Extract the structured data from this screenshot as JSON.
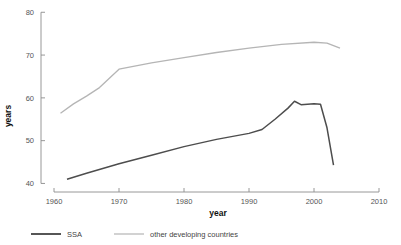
{
  "chart_data": {
    "type": "line",
    "title": "",
    "xlabel": "year",
    "ylabel": "years",
    "xlim": [
      1958,
      2012
    ],
    "ylim": [
      38,
      81
    ],
    "xticks": [
      1960,
      1970,
      1980,
      1990,
      2000,
      2010
    ],
    "yticks": [
      40,
      50,
      60,
      70,
      80
    ],
    "xtick_labels": [
      "1960",
      "1970",
      "1980",
      "1990",
      "2000",
      "2010"
    ],
    "ytick_labels": [
      "40",
      "50",
      "60",
      "70",
      "80"
    ],
    "grid": false,
    "legend_position": "bottom",
    "series": [
      {
        "name": "SSA",
        "color": "#4d4d4d",
        "width": 1.5,
        "x": [
          1962,
          1965,
          1970,
          1975,
          1980,
          1985,
          1990,
          1992,
          1994,
          1996,
          1997,
          1998,
          2000,
          2001,
          2002,
          2003
        ],
        "values": [
          41.0,
          42.4,
          44.6,
          46.6,
          48.6,
          50.3,
          51.7,
          52.6,
          55.0,
          57.6,
          59.2,
          58.4,
          58.6,
          58.5,
          53.0,
          44.3
        ]
      },
      {
        "name": "other developing countries",
        "color": "#b5b5b5",
        "width": 1.3,
        "x": [
          1961,
          1963,
          1965,
          1967,
          1970,
          1975,
          1980,
          1985,
          1990,
          1995,
          2000,
          2002,
          2004
        ],
        "values": [
          56.4,
          58.6,
          60.4,
          62.4,
          66.7,
          68.2,
          69.4,
          70.6,
          71.6,
          72.5,
          73.0,
          72.8,
          71.6
        ]
      }
    ]
  },
  "legend": {
    "items": [
      {
        "label": "SSA",
        "color": "#4d4d4d"
      },
      {
        "label": "other developing countries",
        "color": "#b5b5b5"
      }
    ]
  },
  "axes": {
    "x_title": "year",
    "y_title": "years"
  }
}
